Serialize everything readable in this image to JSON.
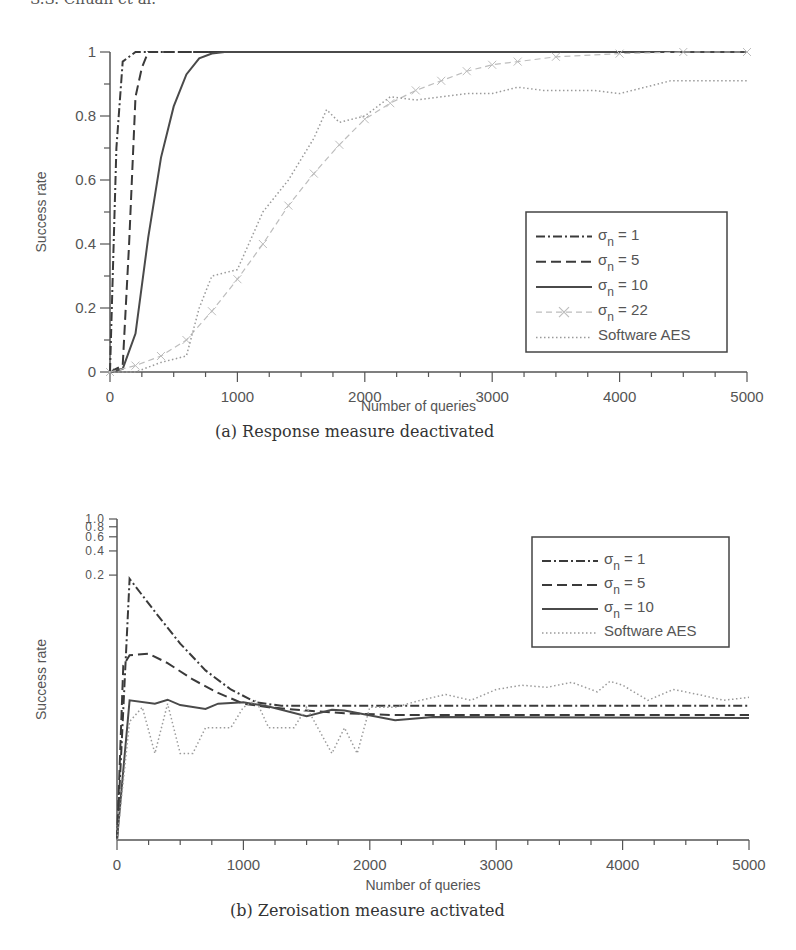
{
  "page": {
    "running_head": "S.S. Chuan et al."
  },
  "chart_data": [
    {
      "id": "a",
      "type": "line",
      "caption": "(a)  Response measure deactivated",
      "xlabel": "Number of queries",
      "ylabel": "Success rate",
      "xlim": [
        0,
        5000
      ],
      "ylim": [
        0,
        1
      ],
      "yscale": "linear",
      "xticks": [
        0,
        1000,
        2000,
        3000,
        4000,
        5000
      ],
      "yticks": [
        0,
        0.2,
        0.4,
        0.6,
        0.8,
        1
      ],
      "ytick_labels": [
        "0",
        "0.2",
        "0.4",
        "0.6",
        "0.8",
        "1"
      ],
      "grid": false,
      "legend_position": "lower right",
      "series": [
        {
          "name": "σn = 1",
          "label_main": "σ",
          "label_sub": "n",
          "label_rest": " = 1",
          "style": "dashdot",
          "color": "#3a3a3a",
          "x": [
            0,
            50,
            100,
            200,
            300,
            5000
          ],
          "y": [
            0,
            0.7,
            0.97,
            1.0,
            1.0,
            1.0
          ]
        },
        {
          "name": "σn = 5",
          "label_main": "σ",
          "label_sub": "n",
          "label_rest": " = 5",
          "style": "dashed",
          "color": "#3a3a3a",
          "x": [
            0,
            100,
            150,
            200,
            250,
            300,
            5000
          ],
          "y": [
            0,
            0.02,
            0.4,
            0.86,
            0.95,
            1.0,
            1.0
          ]
        },
        {
          "name": "σn = 10",
          "label_main": "σ",
          "label_sub": "n",
          "label_rest": " = 10",
          "style": "solid",
          "color": "#4a4a4a",
          "x": [
            0,
            100,
            200,
            300,
            400,
            500,
            600,
            700,
            800,
            900,
            1000,
            5000
          ],
          "y": [
            0,
            0.01,
            0.12,
            0.42,
            0.67,
            0.83,
            0.93,
            0.98,
            0.995,
            1.0,
            1.0,
            1.0
          ]
        },
        {
          "name": "σn = 22",
          "label_main": "σ",
          "label_sub": "n",
          "label_rest": " = 22",
          "style": "cross-marker",
          "color": "#bdbdbd",
          "x": [
            0,
            200,
            400,
            600,
            800,
            1000,
            1200,
            1400,
            1600,
            1800,
            2000,
            2200,
            2400,
            2600,
            2800,
            3000,
            3200,
            3500,
            4000,
            4500,
            5000
          ],
          "y": [
            0,
            0.02,
            0.05,
            0.1,
            0.19,
            0.29,
            0.4,
            0.52,
            0.62,
            0.71,
            0.79,
            0.84,
            0.88,
            0.91,
            0.94,
            0.96,
            0.97,
            0.985,
            0.995,
            1.0,
            1.0
          ]
        },
        {
          "name": "Software AES",
          "label_main": "",
          "label_sub": "",
          "label_rest": "Software AES",
          "style": "dotted",
          "color": "#9a9a9a",
          "x": [
            0,
            200,
            400,
            600,
            700,
            800,
            1000,
            1200,
            1400,
            1600,
            1700,
            1800,
            2000,
            2200,
            2400,
            2600,
            2800,
            3000,
            3200,
            3400,
            3600,
            3800,
            4000,
            4200,
            4400,
            4600,
            4800,
            5000
          ],
          "y": [
            0,
            0.0,
            0.03,
            0.05,
            0.2,
            0.3,
            0.32,
            0.5,
            0.6,
            0.73,
            0.82,
            0.78,
            0.8,
            0.86,
            0.85,
            0.86,
            0.87,
            0.87,
            0.89,
            0.88,
            0.88,
            0.88,
            0.87,
            0.89,
            0.91,
            0.91,
            0.91,
            0.91
          ]
        }
      ]
    },
    {
      "id": "b",
      "type": "line",
      "caption": "(b)  Zeroisation measure activated",
      "xlabel": "Number of queries",
      "ylabel": "Success rate",
      "xlim": [
        0,
        5000
      ],
      "ylim": [
        0.0001,
        1
      ],
      "yscale": "log",
      "xticks": [
        0,
        1000,
        2000,
        3000,
        4000,
        5000
      ],
      "yticks": [
        0.2,
        0.4,
        0.6,
        0.8,
        1.0
      ],
      "ytick_labels": [
        "0.2",
        "0.4",
        "0.6",
        "0.8",
        "1.0"
      ],
      "grid": false,
      "legend_position": "upper right",
      "series": [
        {
          "name": "σn = 1",
          "label_main": "σ",
          "label_sub": "n",
          "label_rest": " = 1",
          "style": "dashdot",
          "color": "#3a3a3a",
          "x": [
            0,
            100,
            300,
            500,
            700,
            900,
            1100,
            1300,
            5000
          ],
          "y": [
            0.0001,
            0.18,
            0.07,
            0.028,
            0.013,
            0.0075,
            0.0052,
            0.0047,
            0.0047
          ]
        },
        {
          "name": "σn = 5",
          "label_main": "σ",
          "label_sub": "n",
          "label_rest": " = 5",
          "style": "dashed",
          "color": "#3a3a3a",
          "x": [
            0,
            50,
            100,
            250,
            400,
            600,
            800,
            1000,
            1200,
            1500,
            1800,
            2200,
            5000
          ],
          "y": [
            0.0001,
            0.015,
            0.02,
            0.021,
            0.016,
            0.01,
            0.0068,
            0.005,
            0.0045,
            0.0041,
            0.0038,
            0.0036,
            0.0036
          ]
        },
        {
          "name": "σn = 10",
          "label_main": "σ",
          "label_sub": "n",
          "label_rest": " = 10",
          "style": "solid",
          "color": "#4a4a4a",
          "x": [
            0,
            100,
            300,
            400,
            500,
            700,
            800,
            1000,
            1200,
            1500,
            1700,
            1800,
            2200,
            2500,
            5000
          ],
          "y": [
            0.0001,
            0.0055,
            0.005,
            0.0056,
            0.0048,
            0.0043,
            0.005,
            0.0052,
            0.0046,
            0.0035,
            0.0042,
            0.0041,
            0.0031,
            0.0034,
            0.0033
          ]
        },
        {
          "name": "Software AES",
          "label_main": "",
          "label_sub": "",
          "label_rest": "Software AES",
          "style": "dotted",
          "color": "#9a9a9a",
          "x": [
            0,
            100,
            200,
            300,
            400,
            500,
            600,
            700,
            900,
            1000,
            1100,
            1200,
            1300,
            1400,
            1500,
            1700,
            1800,
            1900,
            2000,
            2200,
            2400,
            2600,
            2800,
            3000,
            3200,
            3400,
            3600,
            3800,
            3900,
            4000,
            4200,
            4400,
            4600,
            4800,
            5000
          ],
          "y": [
            0.0001,
            0.003,
            0.0045,
            0.0012,
            0.005,
            0.0012,
            0.0012,
            0.0025,
            0.0025,
            0.0045,
            0.0055,
            0.0025,
            0.0025,
            0.0025,
            0.0045,
            0.0012,
            0.0025,
            0.0012,
            0.0045,
            0.0045,
            0.0055,
            0.0065,
            0.0055,
            0.0075,
            0.0085,
            0.008,
            0.0092,
            0.007,
            0.0095,
            0.0085,
            0.0055,
            0.0075,
            0.0065,
            0.0055,
            0.006
          ]
        }
      ]
    }
  ]
}
